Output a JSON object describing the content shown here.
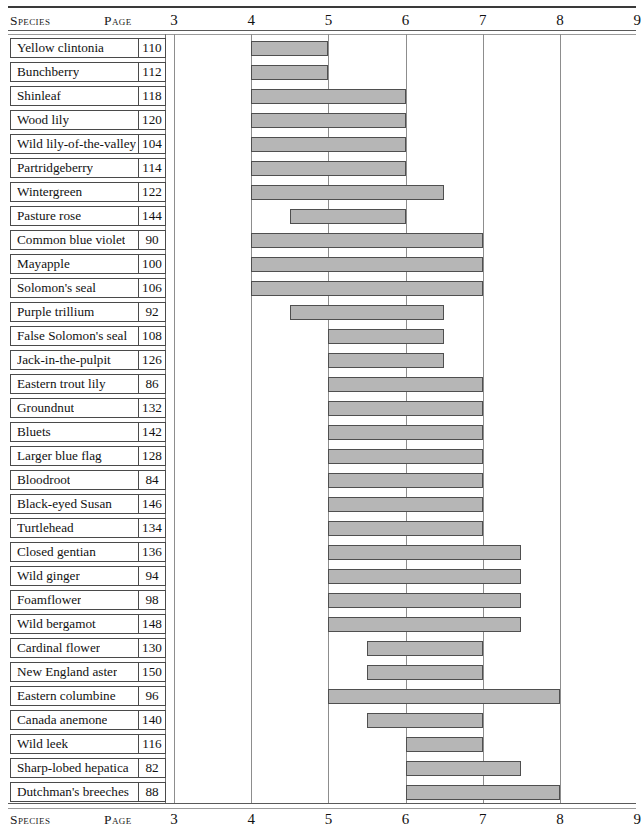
{
  "table": {
    "columns": {
      "species_header": "Species",
      "page_header": "Page"
    }
  },
  "chart_data": {
    "type": "bar",
    "orientation": "horizontal",
    "subtype": "floating-range-bar",
    "title": "",
    "xlabel": "",
    "ylabel": "",
    "xlim": [
      3,
      9
    ],
    "xticks": [
      3,
      4,
      5,
      6,
      7,
      8,
      9
    ],
    "xtick_labels": [
      "3",
      "4",
      "5",
      "6",
      "7",
      "8",
      "9"
    ],
    "grid": true,
    "grid_axis": "x",
    "legend": "none",
    "bar_fill": "#b6b6b6",
    "bar_stroke": "#4f4f4f",
    "categories": [
      "Yellow clintonia",
      "Bunchberry",
      "Shinleaf",
      "Wood lily",
      "Wild lily-of-the-valley",
      "Partridgeberry",
      "Wintergreen",
      "Pasture rose",
      "Common blue violet",
      "Mayapple",
      "Solomon's seal",
      "Purple trillium",
      "False Solomon's seal",
      "Jack-in-the-pulpit",
      "Eastern trout lily",
      "Groundnut",
      "Bluets",
      "Larger blue flag",
      "Bloodroot",
      "Black-eyed Susan",
      "Turtlehead",
      "Closed gentian",
      "Wild ginger",
      "Foamflower",
      "Wild bergamot",
      "Cardinal flower",
      "New England aster",
      "Eastern columbine",
      "Canada anemone",
      "Wild leek",
      "Sharp-lobed hepatica",
      "Dutchman's breeches"
    ],
    "pages": [
      110,
      112,
      118,
      120,
      104,
      114,
      122,
      144,
      90,
      100,
      106,
      92,
      108,
      126,
      86,
      132,
      142,
      128,
      84,
      146,
      134,
      136,
      94,
      98,
      148,
      130,
      150,
      96,
      140,
      116,
      82,
      88
    ],
    "start": [
      4,
      4,
      4,
      4,
      4,
      4,
      4,
      4.5,
      4,
      4,
      4,
      4.5,
      5,
      5,
      5,
      5,
      5,
      5,
      5,
      5,
      5,
      5,
      5,
      5,
      5,
      5.5,
      5.5,
      5,
      5.5,
      6,
      6,
      6
    ],
    "end": [
      5,
      5,
      6,
      6,
      6,
      6,
      6.5,
      6,
      7,
      7,
      7,
      6.5,
      6.5,
      6.5,
      7,
      7,
      7,
      7,
      7,
      7,
      7,
      7.5,
      7.5,
      7.5,
      7.5,
      7,
      7,
      8,
      7,
      7,
      7.5,
      8
    ],
    "rows": [
      {
        "species": "Yellow clintonia",
        "page": 110,
        "start": 4,
        "end": 5
      },
      {
        "species": "Bunchberry",
        "page": 112,
        "start": 4,
        "end": 5
      },
      {
        "species": "Shinleaf",
        "page": 118,
        "start": 4,
        "end": 6
      },
      {
        "species": "Wood lily",
        "page": 120,
        "start": 4,
        "end": 6
      },
      {
        "species": "Wild lily-of-the-valley",
        "page": 104,
        "start": 4,
        "end": 6
      },
      {
        "species": "Partridgeberry",
        "page": 114,
        "start": 4,
        "end": 6
      },
      {
        "species": "Wintergreen",
        "page": 122,
        "start": 4,
        "end": 6.5
      },
      {
        "species": "Pasture rose",
        "page": 144,
        "start": 4.5,
        "end": 6
      },
      {
        "species": "Common blue violet",
        "page": 90,
        "start": 4,
        "end": 7
      },
      {
        "species": "Mayapple",
        "page": 100,
        "start": 4,
        "end": 7
      },
      {
        "species": "Solomon's seal",
        "page": 106,
        "start": 4,
        "end": 7
      },
      {
        "species": "Purple trillium",
        "page": 92,
        "start": 4.5,
        "end": 6.5
      },
      {
        "species": "False Solomon's seal",
        "page": 108,
        "start": 5,
        "end": 6.5
      },
      {
        "species": "Jack-in-the-pulpit",
        "page": 126,
        "start": 5,
        "end": 6.5
      },
      {
        "species": "Eastern trout lily",
        "page": 86,
        "start": 5,
        "end": 7
      },
      {
        "species": "Groundnut",
        "page": 132,
        "start": 5,
        "end": 7
      },
      {
        "species": "Bluets",
        "page": 142,
        "start": 5,
        "end": 7
      },
      {
        "species": "Larger blue flag",
        "page": 128,
        "start": 5,
        "end": 7
      },
      {
        "species": "Bloodroot",
        "page": 84,
        "start": 5,
        "end": 7
      },
      {
        "species": "Black-eyed Susan",
        "page": 146,
        "start": 5,
        "end": 7
      },
      {
        "species": "Turtlehead",
        "page": 134,
        "start": 5,
        "end": 7
      },
      {
        "species": "Closed gentian",
        "page": 136,
        "start": 5,
        "end": 7.5
      },
      {
        "species": "Wild ginger",
        "page": 94,
        "start": 5,
        "end": 7.5
      },
      {
        "species": "Foamflower",
        "page": 98,
        "start": 5,
        "end": 7.5
      },
      {
        "species": "Wild bergamot",
        "page": 148,
        "start": 5,
        "end": 7.5
      },
      {
        "species": "Cardinal flower",
        "page": 130,
        "start": 5.5,
        "end": 7
      },
      {
        "species": "New England aster",
        "page": 150,
        "start": 5.5,
        "end": 7
      },
      {
        "species": "Eastern columbine",
        "page": 96,
        "start": 5,
        "end": 8
      },
      {
        "species": "Canada anemone",
        "page": 140,
        "start": 5.5,
        "end": 7
      },
      {
        "species": "Wild leek",
        "page": 116,
        "start": 6,
        "end": 7
      },
      {
        "species": "Sharp-lobed hepatica",
        "page": 82,
        "start": 6,
        "end": 7.5
      },
      {
        "species": "Dutchman's breeches",
        "page": 88,
        "start": 6,
        "end": 8
      }
    ]
  }
}
